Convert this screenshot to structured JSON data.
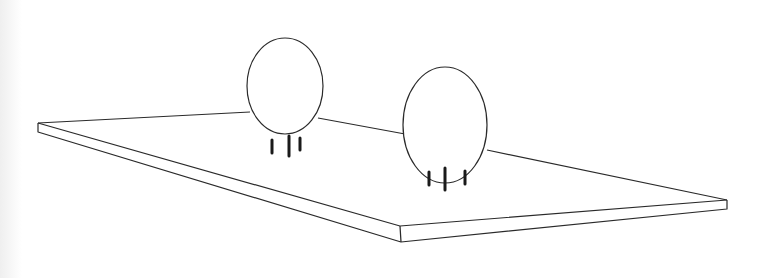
{
  "scene": {
    "description": "Line drawing of a flat rectangular slab in perspective with two oval spheres resting on it, each standing on three short legs",
    "background": "#ffffff",
    "line_color": "#2a2a2a",
    "slab": {
      "top_face": [
        [
          38,
          123
        ],
        [
          250,
          112
        ],
        [
          727,
          200
        ],
        [
          400,
          226
        ]
      ],
      "left_corner": {
        "top": [
          38,
          123
        ],
        "bottom": [
          38,
          132
        ]
      },
      "front_corner": {
        "top": [
          400,
          226
        ],
        "bottom": [
          401,
          242
        ]
      },
      "right_corner": {
        "top": [
          727,
          200
        ],
        "bottom": [
          727,
          209
        ]
      }
    },
    "objects": [
      {
        "name": "sphere-left",
        "cx": 285,
        "cy": 86,
        "rx": 38,
        "ry": 48,
        "legs_x": [
          272,
          288,
          300
        ]
      },
      {
        "name": "sphere-right",
        "cx": 445,
        "cy": 125,
        "rx": 42,
        "ry": 58,
        "legs_x": [
          429,
          445,
          464
        ]
      }
    ]
  }
}
